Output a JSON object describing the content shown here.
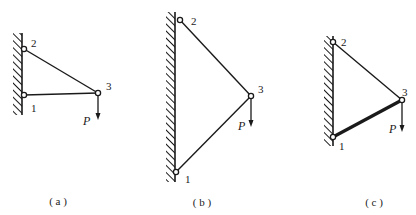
{
  "figures": [
    {
      "id": "a",
      "caption": "( a )",
      "wall": {
        "x": 22,
        "y1": 33,
        "y2": 115
      },
      "nodes": [
        {
          "label": "1",
          "x": 24,
          "y": 95,
          "lx": 31,
          "ly": 112
        },
        {
          "label": "2",
          "x": 24,
          "y": 49,
          "lx": 31,
          "ly": 47
        },
        {
          "label": "3",
          "x": 98,
          "y": 93,
          "lx": 106,
          "ly": 90
        }
      ],
      "bars": [
        {
          "from": "2",
          "to": "3",
          "width": 1.4
        },
        {
          "from": "1",
          "to": "3",
          "width": 1.4
        }
      ],
      "load": {
        "label": "P",
        "node": "3",
        "y_end": 120,
        "lx": 83,
        "ly": 125
      },
      "caption_pos": {
        "x": 58,
        "y": 205
      }
    },
    {
      "id": "b",
      "caption": "( b )",
      "wall": {
        "x": 175,
        "y1": 12,
        "y2": 182
      },
      "nodes": [
        {
          "label": "1",
          "x": 176,
          "y": 172,
          "lx": 185,
          "ly": 183
        },
        {
          "label": "2",
          "x": 180,
          "y": 20,
          "lx": 191,
          "ly": 25
        },
        {
          "label": "3",
          "x": 251,
          "y": 96,
          "lx": 258,
          "ly": 93
        }
      ],
      "bars": [
        {
          "from": "2",
          "to": "3",
          "width": 1.4
        },
        {
          "from": "1",
          "to": "3",
          "width": 1.4
        }
      ],
      "load": {
        "label": "P",
        "node": "3",
        "y_end": 127,
        "lx": 238,
        "ly": 130
      },
      "caption_pos": {
        "x": 202,
        "y": 206
      }
    },
    {
      "id": "c",
      "caption": "( c )",
      "wall": {
        "x": 333,
        "y1": 36,
        "y2": 146
      },
      "nodes": [
        {
          "label": "1",
          "x": 333,
          "y": 137,
          "lx": 339,
          "ly": 150
        },
        {
          "label": "2",
          "x": 333,
          "y": 42,
          "lx": 341,
          "ly": 46
        },
        {
          "label": "3",
          "x": 402,
          "y": 100,
          "lx": 402,
          "ly": 96
        }
      ],
      "bars": [
        {
          "from": "2",
          "to": "3",
          "width": 1.4
        },
        {
          "from": "1",
          "to": "3",
          "width": 3.2
        }
      ],
      "load": {
        "label": "P",
        "node": "3",
        "y_end": 132,
        "lx": 389,
        "ly": 133
      },
      "caption_pos": {
        "x": 374,
        "y": 206
      }
    }
  ],
  "colors": {
    "line": "#1a1a1a",
    "background": "#ffffff"
  }
}
